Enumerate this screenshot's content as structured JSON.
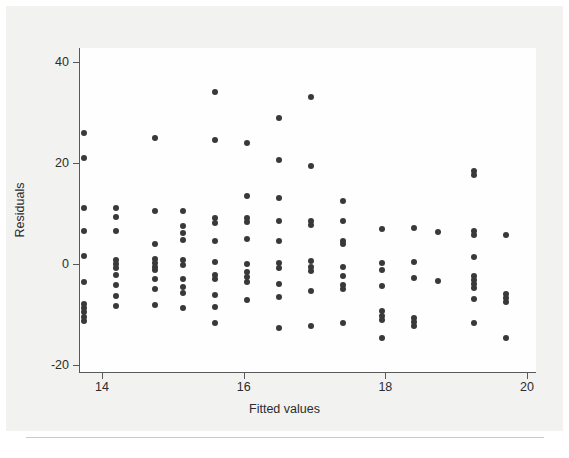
{
  "chart_data": {
    "type": "scatter",
    "title": "",
    "xlabel": "Fitted values",
    "ylabel": "Residuals",
    "xlim": [
      13.55,
      20.0
    ],
    "ylim": [
      -21.0,
      41.5
    ],
    "xticks": [
      14,
      16,
      18,
      20
    ],
    "yticks": [
      40,
      20,
      0,
      -20
    ],
    "xtick_labels": [
      "14",
      "16",
      "18",
      "20"
    ],
    "ytick_labels": [
      "40",
      "20",
      "0",
      "-20"
    ],
    "grid": false,
    "legend": null,
    "marker_color": "#39393b",
    "marker_size": 6,
    "series": [
      {
        "name": "residuals",
        "points": [
          [
            13.75,
            26.0
          ],
          [
            13.75,
            21.0
          ],
          [
            13.75,
            11.0
          ],
          [
            13.75,
            6.5
          ],
          [
            13.75,
            1.5
          ],
          [
            13.75,
            -3.5
          ],
          [
            13.75,
            -8.0
          ],
          [
            13.75,
            -8.8
          ],
          [
            13.75,
            -9.6
          ],
          [
            13.75,
            -10.4
          ],
          [
            13.75,
            -11.2
          ],
          [
            14.2,
            11.0
          ],
          [
            14.2,
            9.3
          ],
          [
            14.2,
            6.5
          ],
          [
            14.2,
            0.8
          ],
          [
            14.2,
            0.0
          ],
          [
            14.2,
            -0.8
          ],
          [
            14.2,
            -2.2
          ],
          [
            14.2,
            -4.2
          ],
          [
            14.2,
            -6.4
          ],
          [
            14.2,
            -8.4
          ],
          [
            14.75,
            25.0
          ],
          [
            14.75,
            10.5
          ],
          [
            14.75,
            4.0
          ],
          [
            14.75,
            0.9
          ],
          [
            14.75,
            0.2
          ],
          [
            14.75,
            -0.5
          ],
          [
            14.75,
            -1.2
          ],
          [
            14.75,
            -3.0
          ],
          [
            14.75,
            -5.0
          ],
          [
            14.75,
            -8.2
          ],
          [
            15.15,
            10.5
          ],
          [
            15.15,
            7.6
          ],
          [
            15.15,
            6.2
          ],
          [
            15.15,
            4.8
          ],
          [
            15.15,
            0.8
          ],
          [
            15.15,
            -0.2
          ],
          [
            15.15,
            -3.0
          ],
          [
            15.15,
            -4.6
          ],
          [
            15.15,
            -5.8
          ],
          [
            15.15,
            -8.8
          ],
          [
            15.6,
            34.0
          ],
          [
            15.6,
            24.5
          ],
          [
            15.6,
            9.2
          ],
          [
            15.6,
            8.2
          ],
          [
            15.6,
            4.5
          ],
          [
            15.6,
            0.3
          ],
          [
            15.6,
            -2.2
          ],
          [
            15.6,
            -3.0
          ],
          [
            15.6,
            -6.2
          ],
          [
            15.6,
            -8.5
          ],
          [
            15.6,
            -11.6
          ],
          [
            16.05,
            24.0
          ],
          [
            16.05,
            13.5
          ],
          [
            16.05,
            9.2
          ],
          [
            16.05,
            8.4
          ],
          [
            16.05,
            5.0
          ],
          [
            16.05,
            0.0
          ],
          [
            16.05,
            -1.5
          ],
          [
            16.05,
            -2.5
          ],
          [
            16.05,
            -3.6
          ],
          [
            16.05,
            -7.2
          ],
          [
            16.5,
            29.0
          ],
          [
            16.5,
            20.5
          ],
          [
            16.5,
            13.0
          ],
          [
            16.5,
            8.6
          ],
          [
            16.5,
            4.5
          ],
          [
            16.5,
            0.2
          ],
          [
            16.5,
            -0.8
          ],
          [
            16.5,
            -4.0
          ],
          [
            16.5,
            -6.5
          ],
          [
            16.5,
            -12.6
          ],
          [
            16.95,
            33.0
          ],
          [
            16.95,
            19.5
          ],
          [
            16.95,
            8.6
          ],
          [
            16.95,
            7.8
          ],
          [
            16.95,
            0.5
          ],
          [
            16.95,
            -0.5
          ],
          [
            16.95,
            -1.4
          ],
          [
            16.95,
            -5.4
          ],
          [
            16.95,
            -12.2
          ],
          [
            17.4,
            12.5
          ],
          [
            17.4,
            8.6
          ],
          [
            17.4,
            4.6
          ],
          [
            17.4,
            4.0
          ],
          [
            17.4,
            -0.6
          ],
          [
            17.4,
            -2.4
          ],
          [
            17.4,
            -4.2
          ],
          [
            17.4,
            -5.0
          ],
          [
            17.4,
            -11.6
          ],
          [
            17.95,
            7.0
          ],
          [
            17.95,
            0.2
          ],
          [
            17.95,
            -1.2
          ],
          [
            17.95,
            -4.4
          ],
          [
            17.95,
            -9.4
          ],
          [
            17.95,
            -10.2
          ],
          [
            17.95,
            -11.0
          ],
          [
            17.95,
            -14.6
          ],
          [
            18.4,
            7.2
          ],
          [
            18.4,
            0.4
          ],
          [
            18.4,
            -2.8
          ],
          [
            18.4,
            -10.6
          ],
          [
            18.4,
            -11.4
          ],
          [
            18.4,
            -12.2
          ],
          [
            18.75,
            6.4
          ],
          [
            18.75,
            -3.4
          ],
          [
            19.25,
            18.5
          ],
          [
            19.25,
            17.6
          ],
          [
            19.25,
            6.6
          ],
          [
            19.25,
            5.8
          ],
          [
            19.25,
            1.4
          ],
          [
            19.25,
            -2.4
          ],
          [
            19.25,
            -3.2
          ],
          [
            19.25,
            -4.0
          ],
          [
            19.25,
            -4.8
          ],
          [
            19.25,
            -7.0
          ],
          [
            19.25,
            -11.6
          ],
          [
            19.7,
            5.8
          ],
          [
            19.7,
            -6.0
          ],
          [
            19.7,
            -6.8
          ],
          [
            19.7,
            -7.6
          ],
          [
            19.7,
            -14.6
          ]
        ]
      }
    ]
  }
}
